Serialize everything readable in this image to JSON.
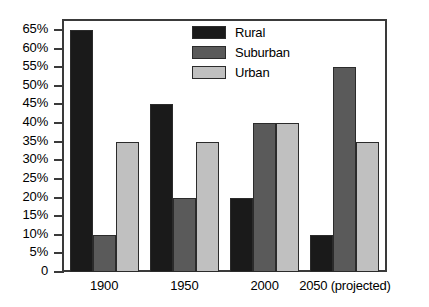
{
  "chart_data": {
    "type": "bar",
    "title": "",
    "xlabel": "",
    "ylabel": "",
    "categories": [
      "1900",
      "1950",
      "2000",
      "2050 (projected)"
    ],
    "series": [
      {
        "name": "Rural",
        "color": "#1a1a1a",
        "values": [
          65,
          45,
          20,
          10
        ]
      },
      {
        "name": "Suburban",
        "color": "#5a5a5a",
        "values": [
          10,
          20,
          40,
          55
        ]
      },
      {
        "name": "Urban",
        "color": "#c0c0c0",
        "values": [
          35,
          35,
          40,
          35
        ]
      }
    ],
    "ylim": [
      0,
      68
    ],
    "yticks": [
      0,
      5,
      10,
      15,
      20,
      25,
      30,
      35,
      40,
      45,
      50,
      55,
      60,
      65
    ],
    "ytick_labels": [
      "0",
      "5%",
      "10%",
      "15%",
      "20%",
      "25%",
      "30%",
      "35%",
      "40%",
      "45%",
      "50%",
      "55%",
      "60%",
      "65%"
    ],
    "grid": false,
    "legend_position": "top-center",
    "axis_color": "#3a3a3a",
    "background": "#ffffff"
  }
}
